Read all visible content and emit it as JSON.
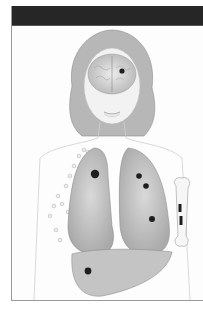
{
  "figure": {
    "header_bar_color": "#262626",
    "regions": [
      {
        "name": "head",
        "lesions": 1
      },
      {
        "name": "brain",
        "lesions": 1
      },
      {
        "name": "right-lung",
        "lesions": 1
      },
      {
        "name": "left-lung",
        "lesions": 3
      },
      {
        "name": "liver",
        "lesions": 1
      },
      {
        "name": "humerus-bone",
        "lesions": 2
      },
      {
        "name": "breast-lymph-nodes",
        "lesions": 0
      }
    ],
    "colors": {
      "lesion": "#1e1e1e",
      "organ_shade": "#b5b5b5",
      "skin_line": "#c8c8c8",
      "hair": "#9d9d9d"
    }
  }
}
